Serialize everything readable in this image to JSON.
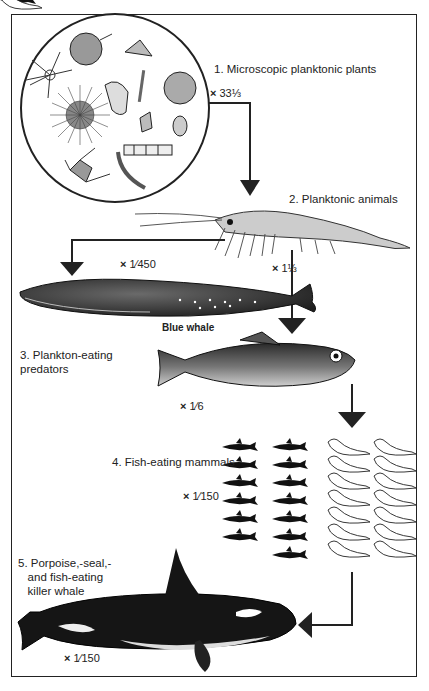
{
  "stages": [
    {
      "label": "1. Microscopic planktonic plants",
      "scale": "× 33⅓",
      "scale_x": "×",
      "scale_val": "33⅓"
    },
    {
      "label": "2. Planktonic animals",
      "scale_x": "×",
      "scale_val": "1⅓"
    },
    {
      "label": "3. Plankton-eating\npredators",
      "caption": "Blue whale",
      "scale_whale_x": "×",
      "scale_whale_val": "1⁄450",
      "scale_fish_x": "×",
      "scale_fish_val": "1⁄6"
    },
    {
      "label": "4. Fish-eating mammals",
      "scale_x": "×",
      "scale_val": "1⁄150"
    },
    {
      "label": "5. Porpoise,-seal,-\n   and fish-eating\n   killer whale",
      "scale_x": "×",
      "scale_val": "1⁄150"
    }
  ],
  "colors": {
    "ink": "#1a1a1a",
    "background": "#ffffff",
    "frame": "#222222"
  }
}
